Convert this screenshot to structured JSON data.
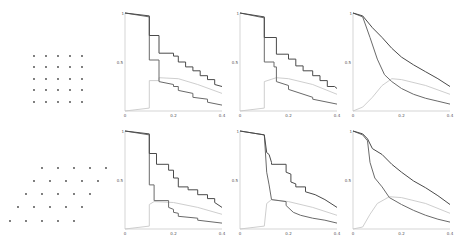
{
  "figure": {
    "lattices": [
      {
        "name": "square-lattice",
        "points": [
          [
            34,
            56
          ],
          [
            46,
            56
          ],
          [
            58,
            56
          ],
          [
            70,
            56
          ],
          [
            82,
            56
          ],
          [
            34,
            67
          ],
          [
            46,
            67
          ],
          [
            58,
            67
          ],
          [
            70,
            67
          ],
          [
            82,
            67
          ],
          [
            34,
            79
          ],
          [
            46,
            79
          ],
          [
            58,
            79
          ],
          [
            70,
            79
          ],
          [
            82,
            79
          ],
          [
            34,
            90
          ],
          [
            46,
            90
          ],
          [
            58,
            90
          ],
          [
            70,
            90
          ],
          [
            82,
            90
          ],
          [
            34,
            102
          ],
          [
            46,
            102
          ],
          [
            58,
            102
          ],
          [
            70,
            102
          ],
          [
            82,
            102
          ]
        ]
      },
      {
        "name": "hexagonal-lattice",
        "points": [
          [
            42,
            44
          ],
          [
            58,
            44
          ],
          [
            74,
            44
          ],
          [
            90,
            44
          ],
          [
            106,
            44
          ],
          [
            34,
            57
          ],
          [
            50,
            57
          ],
          [
            66,
            57
          ],
          [
            82,
            57
          ],
          [
            98,
            57
          ],
          [
            26,
            70
          ],
          [
            42,
            70
          ],
          [
            58,
            70
          ],
          [
            74,
            70
          ],
          [
            90,
            70
          ],
          [
            18,
            83
          ],
          [
            34,
            83
          ],
          [
            50,
            83
          ],
          [
            66,
            83
          ],
          [
            82,
            83
          ],
          [
            10,
            97
          ],
          [
            26,
            97
          ],
          [
            42,
            97
          ],
          [
            58,
            97
          ],
          [
            74,
            97
          ]
        ]
      }
    ],
    "series_colors": {
      "top": "#4a4a4a",
      "middle": "#6a6a6a",
      "rising": "#c8c8c8",
      "axis": "#bbbbbb"
    }
  },
  "chart_data": [
    {
      "type": "line",
      "row": 1,
      "col": 1,
      "title": "",
      "xlabel": "",
      "ylabel": "",
      "xlim": [
        0,
        0.4
      ],
      "ylim": [
        0,
        1
      ],
      "x_ticks": [
        "0",
        "0.2",
        "0.4"
      ],
      "y_ticks": [
        "0.5",
        "1"
      ],
      "series": [
        {
          "name": "upper",
          "x": [
            0,
            0.1,
            0.1,
            0.14,
            0.14,
            0.2,
            0.2,
            0.22,
            0.22,
            0.25,
            0.25,
            0.28,
            0.28,
            0.31,
            0.31,
            0.34,
            0.34,
            0.37,
            0.37,
            0.4
          ],
          "values": [
            1,
            0.97,
            0.77,
            0.77,
            0.59,
            0.59,
            0.56,
            0.56,
            0.5,
            0.5,
            0.45,
            0.45,
            0.41,
            0.41,
            0.36,
            0.36,
            0.32,
            0.32,
            0.27,
            0.25
          ]
        },
        {
          "name": "lower",
          "x": [
            0,
            0.1,
            0.1,
            0.14,
            0.14,
            0.2,
            0.2,
            0.22,
            0.22,
            0.28,
            0.28,
            0.34,
            0.34,
            0.4
          ],
          "values": [
            1,
            0.96,
            0.52,
            0.52,
            0.3,
            0.27,
            0.25,
            0.25,
            0.21,
            0.18,
            0.14,
            0.12,
            0.09,
            0.06
          ]
        },
        {
          "name": "rising",
          "x": [
            0,
            0.1,
            0.1,
            0.14,
            0.14,
            0.22,
            0.3,
            0.4
          ],
          "values": [
            0,
            0.03,
            0.31,
            0.31,
            0.34,
            0.33,
            0.27,
            0.18
          ]
        }
      ]
    },
    {
      "type": "line",
      "row": 1,
      "col": 2,
      "title": "",
      "xlim": [
        0,
        0.4
      ],
      "ylim": [
        0,
        1
      ],
      "x_ticks": [
        "0",
        "0.2",
        "0.4"
      ],
      "y_ticks": [
        "0.5",
        "1"
      ],
      "series": [
        {
          "name": "upper",
          "x": [
            0,
            0.1,
            0.1,
            0.15,
            0.15,
            0.2,
            0.2,
            0.23,
            0.23,
            0.26,
            0.26,
            0.3,
            0.3,
            0.33,
            0.33,
            0.36,
            0.36,
            0.39,
            0.4
          ],
          "values": [
            1,
            0.96,
            0.75,
            0.75,
            0.58,
            0.58,
            0.53,
            0.53,
            0.46,
            0.46,
            0.41,
            0.41,
            0.36,
            0.36,
            0.31,
            0.31,
            0.25,
            0.25,
            0.23
          ]
        },
        {
          "name": "lower",
          "x": [
            0,
            0.1,
            0.1,
            0.14,
            0.14,
            0.15,
            0.15,
            0.2,
            0.2,
            0.3,
            0.3,
            0.4
          ],
          "values": [
            1,
            0.95,
            0.5,
            0.5,
            0.45,
            0.45,
            0.3,
            0.26,
            0.22,
            0.14,
            0.12,
            0.07
          ]
        },
        {
          "name": "rising",
          "x": [
            0,
            0.1,
            0.1,
            0.15,
            0.2,
            0.3,
            0.4
          ],
          "values": [
            0,
            0.03,
            0.3,
            0.34,
            0.33,
            0.27,
            0.17
          ]
        }
      ]
    },
    {
      "type": "line",
      "row": 1,
      "col": 3,
      "title": "",
      "xlim": [
        0,
        0.4
      ],
      "ylim": [
        0,
        1
      ],
      "x_ticks": [
        "0",
        "0.2",
        "0.4"
      ],
      "y_ticks": [
        "0.5",
        "1"
      ],
      "series": [
        {
          "name": "upper",
          "x": [
            0,
            0.04,
            0.08,
            0.12,
            0.16,
            0.2,
            0.25,
            0.3,
            0.35,
            0.4
          ],
          "values": [
            1,
            0.97,
            0.85,
            0.75,
            0.64,
            0.55,
            0.47,
            0.4,
            0.33,
            0.25
          ]
        },
        {
          "name": "lower",
          "x": [
            0,
            0.04,
            0.07,
            0.1,
            0.13,
            0.16,
            0.2,
            0.25,
            0.3,
            0.35,
            0.4
          ],
          "values": [
            1,
            0.96,
            0.75,
            0.53,
            0.37,
            0.3,
            0.23,
            0.17,
            0.13,
            0.1,
            0.07
          ]
        },
        {
          "name": "rising",
          "x": [
            0,
            0.04,
            0.08,
            0.12,
            0.16,
            0.2,
            0.3,
            0.4
          ],
          "values": [
            0,
            0.04,
            0.14,
            0.26,
            0.33,
            0.32,
            0.26,
            0.17
          ]
        }
      ]
    },
    {
      "type": "line",
      "row": 2,
      "col": 1,
      "title": "",
      "xlim": [
        0,
        0.4
      ],
      "ylim": [
        0,
        1
      ],
      "x_ticks": [
        "0",
        "0.2",
        "0.4"
      ],
      "y_ticks": [
        "0.5",
        "1"
      ],
      "series": [
        {
          "name": "upper",
          "x": [
            0,
            0.1,
            0.1,
            0.13,
            0.13,
            0.18,
            0.18,
            0.2,
            0.2,
            0.22,
            0.22,
            0.26,
            0.26,
            0.3,
            0.3,
            0.34,
            0.34,
            0.37,
            0.37,
            0.4
          ],
          "values": [
            1,
            0.97,
            0.77,
            0.77,
            0.66,
            0.66,
            0.6,
            0.6,
            0.52,
            0.52,
            0.43,
            0.43,
            0.4,
            0.4,
            0.35,
            0.35,
            0.31,
            0.31,
            0.27,
            0.22
          ]
        },
        {
          "name": "lower",
          "x": [
            0,
            0.1,
            0.1,
            0.12,
            0.12,
            0.18,
            0.18,
            0.2,
            0.2,
            0.22,
            0.22,
            0.3,
            0.3,
            0.4
          ],
          "values": [
            1,
            0.96,
            0.45,
            0.45,
            0.29,
            0.29,
            0.22,
            0.2,
            0.17,
            0.16,
            0.13,
            0.11,
            0.09,
            0.06
          ]
        },
        {
          "name": "rising",
          "x": [
            0,
            0.1,
            0.1,
            0.12,
            0.2,
            0.3,
            0.4
          ],
          "values": [
            0,
            0.03,
            0.25,
            0.28,
            0.27,
            0.22,
            0.15
          ]
        }
      ]
    },
    {
      "type": "line",
      "row": 2,
      "col": 2,
      "title": "",
      "xlim": [
        0,
        0.4
      ],
      "ylim": [
        0,
        1
      ],
      "x_ticks": [
        "0",
        "0.2",
        "0.4"
      ],
      "y_ticks": [
        "0.5",
        "1"
      ],
      "series": [
        {
          "name": "upper",
          "x": [
            0,
            0.1,
            0.11,
            0.12,
            0.13,
            0.13,
            0.19,
            0.19,
            0.21,
            0.21,
            0.23,
            0.23,
            0.27,
            0.27,
            0.31,
            0.35,
            0.4
          ],
          "values": [
            1,
            0.96,
            0.78,
            0.76,
            0.68,
            0.66,
            0.66,
            0.58,
            0.56,
            0.48,
            0.46,
            0.43,
            0.43,
            0.38,
            0.35,
            0.3,
            0.22
          ]
        },
        {
          "name": "lower",
          "x": [
            0,
            0.1,
            0.11,
            0.12,
            0.13,
            0.19,
            0.19,
            0.22,
            0.25,
            0.3,
            0.35,
            0.4
          ],
          "values": [
            1,
            0.96,
            0.58,
            0.45,
            0.3,
            0.28,
            0.24,
            0.17,
            0.14,
            0.11,
            0.09,
            0.06
          ]
        },
        {
          "name": "rising",
          "x": [
            0,
            0.1,
            0.11,
            0.13,
            0.2,
            0.3,
            0.4
          ],
          "values": [
            0,
            0.03,
            0.26,
            0.3,
            0.28,
            0.22,
            0.14
          ]
        }
      ]
    },
    {
      "type": "line",
      "row": 2,
      "col": 3,
      "title": "",
      "xlim": [
        0,
        0.4
      ],
      "ylim": [
        0,
        1
      ],
      "x_ticks": [
        "0",
        "0.2",
        "0.4"
      ],
      "y_ticks": [
        "0.5",
        "1"
      ],
      "series": [
        {
          "name": "upper",
          "x": [
            0,
            0.04,
            0.06,
            0.08,
            0.12,
            0.16,
            0.2,
            0.25,
            0.3,
            0.35,
            0.4
          ],
          "values": [
            1,
            0.97,
            0.92,
            0.82,
            0.76,
            0.66,
            0.58,
            0.49,
            0.42,
            0.34,
            0.25
          ]
        },
        {
          "name": "lower",
          "x": [
            0,
            0.04,
            0.06,
            0.07,
            0.09,
            0.12,
            0.15,
            0.2,
            0.25,
            0.3,
            0.35,
            0.4
          ],
          "values": [
            1,
            0.96,
            0.9,
            0.68,
            0.52,
            0.43,
            0.32,
            0.25,
            0.19,
            0.14,
            0.1,
            0.07
          ]
        },
        {
          "name": "rising",
          "x": [
            0,
            0.04,
            0.07,
            0.1,
            0.15,
            0.2,
            0.3,
            0.4
          ],
          "values": [
            0,
            0.02,
            0.15,
            0.26,
            0.33,
            0.32,
            0.26,
            0.16
          ]
        }
      ]
    }
  ]
}
